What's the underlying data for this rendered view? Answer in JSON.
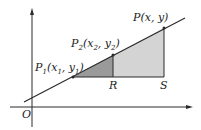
{
  "diagram": {
    "colors": {
      "line": "#2a2a2a",
      "small_triangle": "#9a9a9a",
      "large_triangle": "#d4d4d4",
      "text": "#222222"
    },
    "origin_label": "O",
    "points": {
      "p1": {
        "label": "P",
        "sub": "1",
        "coords_open": "(x",
        "x_sub": "1",
        "sep": ", y",
        "y_sub": "1",
        "close": ")"
      },
      "p2": {
        "label": "P",
        "sub": "2",
        "coords_open": "(x",
        "x_sub": "2",
        "sep": ", y",
        "y_sub": "2",
        "close": ")"
      },
      "p": {
        "text": "P(x, y)"
      },
      "r": {
        "text": "R"
      },
      "s": {
        "text": "S"
      }
    }
  }
}
